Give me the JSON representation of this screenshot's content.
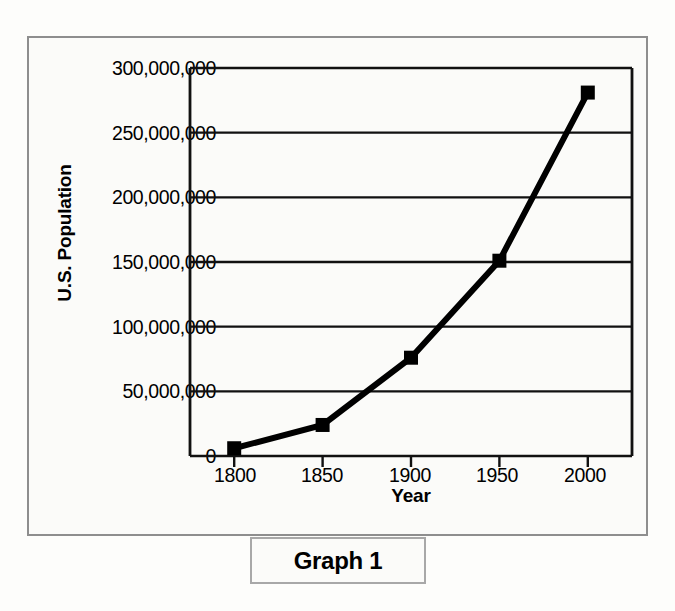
{
  "figure": {
    "caption": "Graph 1",
    "background_color": "#fbfbf9",
    "frame_color": "#8e8e8e",
    "caption_border_color": "#a8a8a8"
  },
  "chart_data": {
    "type": "line",
    "title": "",
    "xlabel": "Year",
    "ylabel": "U.S. Population",
    "x": [
      1800,
      1850,
      1900,
      1950,
      2000
    ],
    "values": [
      6000000,
      24000000,
      76000000,
      151000000,
      281000000
    ],
    "categories": [
      "1800",
      "1850",
      "1900",
      "1950",
      "2000"
    ],
    "xtick_labels": [
      "1800",
      "1850",
      "1900",
      "1950",
      "2000"
    ],
    "ytick_labels": [
      "300,000,000",
      "250,000,000",
      "200,000,000",
      "150,000,000",
      "100,000,000",
      "50,000,000",
      "0"
    ],
    "ytick_values": [
      300000000,
      250000000,
      200000000,
      150000000,
      100000000,
      50000000,
      0
    ],
    "xlim": [
      1775,
      2025
    ],
    "ylim": [
      0,
      300000000
    ],
    "grid": "horizontal",
    "legend": "none",
    "series_color": "#000000",
    "marker": "square",
    "line_width": 6
  }
}
